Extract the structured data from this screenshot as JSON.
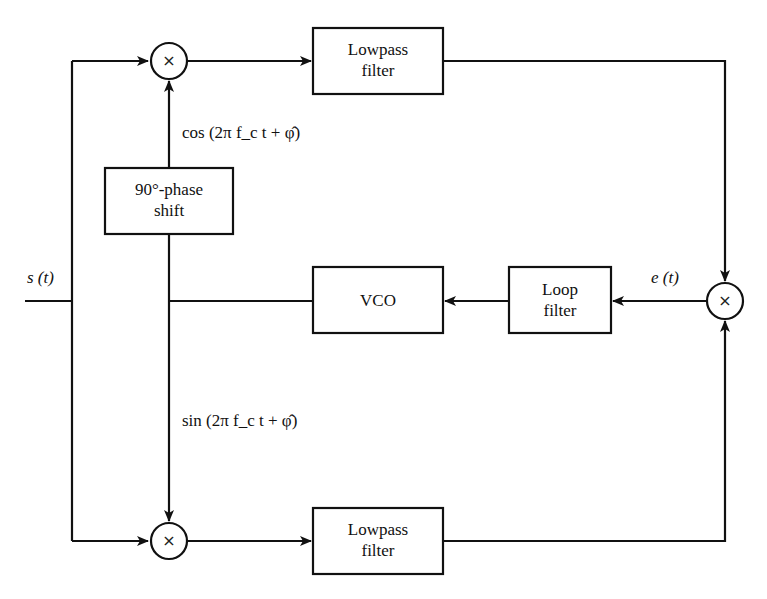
{
  "diagram": {
    "type": "block-diagram",
    "blocks": {
      "lowpass_top": {
        "line1": "Lowpass",
        "line2": "filter"
      },
      "phase_shift": {
        "line1": "90°-phase",
        "line2": "shift"
      },
      "vco": {
        "label": "VCO"
      },
      "loop_filter": {
        "line1": "Loop",
        "line2": "filter"
      },
      "lowpass_bottom": {
        "line1": "Lowpass",
        "line2": "filter"
      }
    },
    "multipliers": {
      "top": "×",
      "right": "×",
      "bottom": "×"
    },
    "signals": {
      "input": "s (t)",
      "error": "e (t)",
      "cos_ref": "cos (2π f_c t + φ̂)",
      "sin_ref": "sin (2π f_c t + φ̂)"
    },
    "connections": [
      [
        "input",
        "multiplier_top"
      ],
      [
        "input",
        "multiplier_bottom"
      ],
      [
        "multiplier_top",
        "lowpass_top"
      ],
      [
        "lowpass_top",
        "multiplier_right"
      ],
      [
        "multiplier_bottom",
        "lowpass_bottom"
      ],
      [
        "lowpass_bottom",
        "multiplier_right"
      ],
      [
        "multiplier_right",
        "loop_filter"
      ],
      [
        "loop_filter",
        "vco"
      ],
      [
        "vco",
        "phase_shift"
      ],
      [
        "phase_shift",
        "multiplier_top"
      ],
      [
        "vco",
        "multiplier_bottom"
      ]
    ],
    "colors": {
      "stroke": "#111111",
      "background": "#ffffff"
    }
  }
}
